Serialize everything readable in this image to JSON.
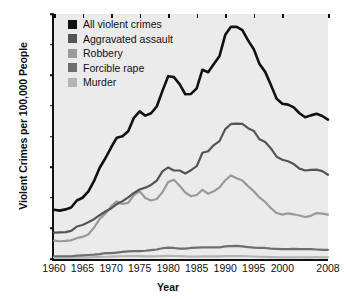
{
  "chart_data": {
    "type": "line",
    "title": "",
    "xlabel": "Year",
    "ylabel": "Violent Crimes per 100,000 People",
    "xlim": [
      1960,
      2008
    ],
    "ylim": [
      0,
      800
    ],
    "grid": false,
    "legend_position": "top-left",
    "xticks": [
      1960,
      1965,
      1970,
      1975,
      1980,
      1985,
      1990,
      1995,
      2000,
      2008
    ],
    "xtick_labels": [
      "1960",
      "1965",
      "1970",
      "1975",
      "1980",
      "1985",
      "1990",
      "1995",
      "2000",
      "2008"
    ],
    "yticks": [
      0,
      100,
      200,
      300,
      400,
      500,
      600,
      700,
      800
    ],
    "ytick_labels": [
      "0",
      "100",
      "200",
      "300",
      "400",
      "500",
      "600",
      "700",
      "800"
    ],
    "x": [
      1960,
      1961,
      1962,
      1963,
      1964,
      1965,
      1966,
      1967,
      1968,
      1969,
      1970,
      1971,
      1972,
      1973,
      1974,
      1975,
      1976,
      1977,
      1978,
      1979,
      1980,
      1981,
      1982,
      1983,
      1984,
      1985,
      1986,
      1987,
      1988,
      1989,
      1990,
      1991,
      1992,
      1993,
      1994,
      1995,
      1996,
      1997,
      1998,
      1999,
      2000,
      2001,
      2002,
      2003,
      2004,
      2005,
      2006,
      2007,
      2008
    ],
    "series": [
      {
        "name": "All violent crimes",
        "color": "#111111",
        "values": [
          161,
          158,
          162,
          168,
          191,
          200,
          220,
          254,
          298,
          329,
          364,
          396,
          401,
          417,
          461,
          482,
          468,
          476,
          498,
          549,
          597,
          594,
          571,
          538,
          539,
          557,
          618,
          610,
          637,
          663,
          732,
          758,
          758,
          747,
          714,
          685,
          637,
          611,
          568,
          523,
          507,
          504,
          495,
          476,
          463,
          469,
          474,
          467,
          455
        ]
      },
      {
        "name": "Aggravated assault",
        "color": "#555555",
        "values": [
          86,
          87,
          88,
          92,
          106,
          111,
          120,
          130,
          143,
          155,
          165,
          179,
          189,
          201,
          216,
          227,
          233,
          242,
          256,
          286,
          299,
          289,
          289,
          279,
          290,
          303,
          347,
          352,
          372,
          385,
          424,
          441,
          442,
          441,
          427,
          418,
          391,
          382,
          361,
          334,
          324,
          319,
          310,
          295,
          289,
          291,
          292,
          287,
          275
        ]
      },
      {
        "name": "Robbery",
        "color": "#9a9a9a",
        "values": [
          60,
          58,
          59,
          61,
          68,
          72,
          80,
          102,
          131,
          148,
          172,
          188,
          180,
          183,
          209,
          221,
          199,
          191,
          196,
          218,
          251,
          259,
          239,
          217,
          205,
          209,
          226,
          213,
          221,
          234,
          257,
          273,
          264,
          256,
          238,
          221,
          201,
          186,
          166,
          150,
          145,
          149,
          146,
          142,
          137,
          141,
          150,
          148,
          145
        ]
      },
      {
        "name": "Forcible rape",
        "color": "#6e6e6e",
        "values": [
          9,
          9,
          9,
          9,
          11,
          12,
          13,
          14,
          16,
          19,
          19,
          21,
          23,
          25,
          26,
          26,
          27,
          29,
          31,
          35,
          37,
          36,
          34,
          34,
          36,
          37,
          38,
          38,
          38,
          38,
          41,
          42,
          43,
          41,
          39,
          37,
          36,
          36,
          34,
          33,
          32,
          32,
          33,
          32,
          32,
          32,
          31,
          30,
          30
        ]
      },
      {
        "name": "Murder",
        "color": "#b4b4b4",
        "values": [
          5.1,
          4.8,
          4.6,
          4.6,
          4.9,
          5.1,
          5.6,
          6.2,
          6.9,
          7.3,
          7.9,
          8.6,
          9.0,
          9.4,
          9.8,
          9.6,
          8.8,
          8.8,
          9.0,
          9.7,
          10.2,
          9.8,
          9.1,
          8.3,
          7.9,
          8.0,
          8.6,
          8.3,
          8.4,
          8.7,
          9.4,
          9.8,
          9.3,
          9.5,
          9.0,
          8.2,
          7.4,
          6.8,
          6.3,
          5.7,
          5.5,
          5.6,
          5.6,
          5.7,
          5.5,
          5.6,
          5.8,
          5.6,
          5.4
        ]
      }
    ]
  },
  "axes": {
    "ylabel": "Violent Crimes per 100,000 People",
    "xlabel": "Year"
  },
  "legend": {
    "items": [
      {
        "label": "All violent crimes",
        "color": "#111111"
      },
      {
        "label": "Aggravated assault",
        "color": "#555555"
      },
      {
        "label": "Robbery",
        "color": "#9a9a9a"
      },
      {
        "label": "Forcible rape",
        "color": "#6e6e6e"
      },
      {
        "label": "Murder",
        "color": "#b4b4b4"
      }
    ]
  }
}
